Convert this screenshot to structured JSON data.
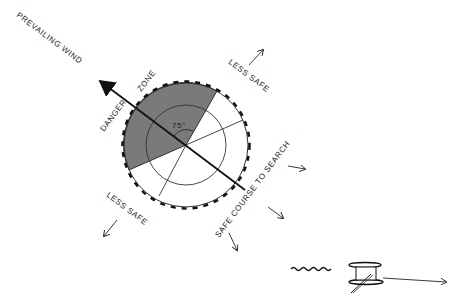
{
  "diagram": {
    "labels": {
      "prevailing_wind": "PREVAILING WIND",
      "danger": "DANGER",
      "zone": "ZONE",
      "less_safe_top": "LESS SAFE",
      "less_safe_bottom": "LESS SAFE",
      "safe_course": "SAFE COURSE TO SEARCH",
      "angle": "75°"
    },
    "colors": {
      "line": "#1a1a1a",
      "danger_fill": "#7a7a7a",
      "background": "#ffffff"
    },
    "elements": [
      "wind-arrow",
      "danger-zone-sector",
      "outer-circle",
      "inner-circle",
      "radial-lines",
      "drift-arrows",
      "aircraft-with-trail-icon"
    ]
  }
}
